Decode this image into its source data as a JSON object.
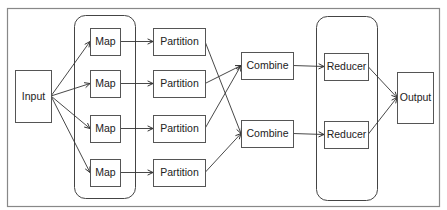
{
  "diagram": {
    "title": "",
    "nodes": [
      {
        "id": "input",
        "label": "Input"
      },
      {
        "id": "map1",
        "label": "Map"
      },
      {
        "id": "map2",
        "label": "Map"
      },
      {
        "id": "map3",
        "label": "Map"
      },
      {
        "id": "map4",
        "label": "Map"
      },
      {
        "id": "part1",
        "label": "Partition"
      },
      {
        "id": "part2",
        "label": "Partition"
      },
      {
        "id": "part3",
        "label": "Partition"
      },
      {
        "id": "part4",
        "label": "Partition"
      },
      {
        "id": "comb1",
        "label": "Combine"
      },
      {
        "id": "comb2",
        "label": "Combine"
      },
      {
        "id": "red1",
        "label": "Reducer"
      },
      {
        "id": "red2",
        "label": "Reducer"
      },
      {
        "id": "output",
        "label": "Output"
      }
    ],
    "groups": [
      {
        "id": "map-group",
        "members": [
          "map1",
          "map2",
          "map3",
          "map4"
        ]
      },
      {
        "id": "reducer-group",
        "members": [
          "red1",
          "red2"
        ]
      }
    ],
    "edges": [
      [
        "input",
        "map1"
      ],
      [
        "input",
        "map2"
      ],
      [
        "input",
        "map3"
      ],
      [
        "input",
        "map4"
      ],
      [
        "map1",
        "part1"
      ],
      [
        "map2",
        "part2"
      ],
      [
        "map3",
        "part3"
      ],
      [
        "map4",
        "part4"
      ],
      [
        "part1",
        "comb2"
      ],
      [
        "part2",
        "comb1"
      ],
      [
        "part3",
        "comb1"
      ],
      [
        "part4",
        "comb2"
      ],
      [
        "comb1",
        "red1"
      ],
      [
        "comb2",
        "red2"
      ],
      [
        "red1",
        "output"
      ],
      [
        "red2",
        "output"
      ]
    ]
  }
}
